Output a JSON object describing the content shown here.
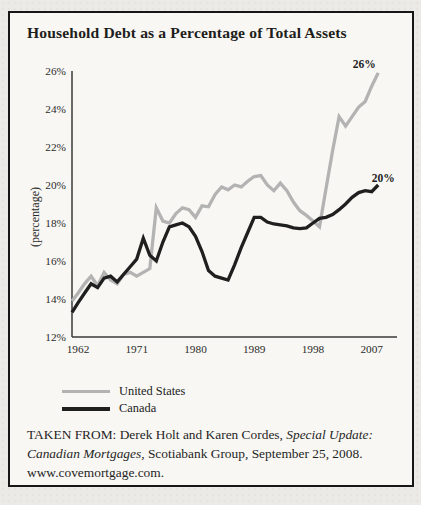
{
  "figure": {
    "title": "Household Debt as a Percentage of Total Assets",
    "legend": [
      {
        "label": "United States",
        "color": "#b3b3b3",
        "thickness": 3
      },
      {
        "label": "Canada",
        "color": "#1f1f1f",
        "thickness": 4
      }
    ],
    "source": {
      "lines": [
        [
          {
            "text": "TAKEN FROM: Derek Holt and Karen Cordes, ",
            "italic": false
          },
          {
            "text": "Special Update:",
            "italic": true
          }
        ],
        [
          {
            "text": "Canadian Mortgages,",
            "italic": true
          },
          {
            "text": " Scotiabank Group, September 25, 2008.",
            "italic": false
          }
        ],
        [
          {
            "text": "www.covemortgage.com.",
            "italic": false
          }
        ]
      ]
    }
  },
  "chart_data": {
    "type": "line",
    "title": "Household Debt as a Percentage of Total Assets",
    "xlabel": "",
    "ylabel": "(percentage)",
    "ylim": [
      12,
      26
    ],
    "xlim": [
      1961,
      2011
    ],
    "grid": false,
    "legend_position": "below-left",
    "yticks": [
      12,
      14,
      16,
      18,
      20,
      22,
      24,
      26
    ],
    "ytick_suffix": "%",
    "xticks": [
      1962,
      1971,
      1980,
      1989,
      1998,
      2007
    ],
    "x": [
      1961,
      1962,
      1963,
      1964,
      1965,
      1966,
      1967,
      1968,
      1969,
      1970,
      1971,
      1972,
      1973,
      1974,
      1975,
      1976,
      1977,
      1978,
      1979,
      1980,
      1981,
      1982,
      1983,
      1984,
      1985,
      1986,
      1987,
      1988,
      1989,
      1990,
      1991,
      1992,
      1993,
      1994,
      1995,
      1996,
      1997,
      1998,
      1999,
      2000,
      2001,
      2002,
      2003,
      2004,
      2005,
      2006,
      2007,
      2008
    ],
    "series": [
      {
        "name": "United States",
        "color": "#b3b3b3",
        "end_label": "26%",
        "values": [
          13.9,
          14.3,
          14.8,
          15.2,
          14.7,
          15.4,
          15.0,
          14.8,
          15.3,
          15.4,
          15.2,
          15.4,
          15.6,
          18.8,
          18.1,
          18.0,
          18.5,
          18.8,
          18.7,
          18.3,
          18.9,
          18.85,
          19.5,
          19.9,
          19.75,
          20.0,
          19.9,
          20.2,
          20.45,
          20.5,
          20.0,
          19.7,
          20.1,
          19.7,
          19.1,
          18.65,
          18.4,
          18.1,
          17.8,
          19.8,
          21.8,
          23.6,
          23.1,
          23.6,
          24.1,
          24.4,
          25.2,
          25.9
        ]
      },
      {
        "name": "Canada",
        "color": "#1f1f1f",
        "end_label": "20%",
        "values": [
          13.3,
          13.8,
          14.3,
          14.8,
          14.6,
          15.1,
          15.2,
          14.9,
          15.3,
          15.7,
          16.1,
          17.2,
          16.3,
          16.0,
          17.0,
          17.8,
          17.9,
          18.0,
          17.8,
          17.3,
          16.5,
          15.5,
          15.2,
          15.1,
          15.0,
          15.8,
          16.7,
          17.5,
          18.3,
          18.3,
          18.05,
          17.95,
          17.9,
          17.85,
          17.75,
          17.7,
          17.75,
          18.0,
          18.25,
          18.3,
          18.45,
          18.7,
          19.0,
          19.35,
          19.6,
          19.7,
          19.65,
          20.0
        ]
      }
    ]
  }
}
